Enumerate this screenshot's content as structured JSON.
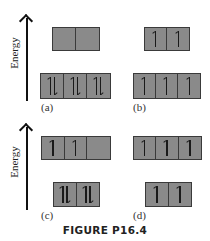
{
  "figure": {
    "caption": "FIGURE P16.4",
    "axis_label": "Energy",
    "panels": [
      {
        "label": "(a)",
        "upper_level": {
          "orbitals": 2,
          "electrons": [
            "",
            ""
          ]
        },
        "lower_level": {
          "orbitals": 3,
          "electrons": [
            "updown",
            "updown",
            "updown"
          ]
        }
      },
      {
        "label": "(b)",
        "upper_level": {
          "orbitals": 2,
          "electrons": [
            "up",
            "up"
          ]
        },
        "lower_level": {
          "orbitals": 3,
          "electrons": [
            "up",
            "up",
            "up"
          ]
        }
      },
      {
        "label": "(c)",
        "upper_level": {
          "orbitals": 3,
          "electrons": [
            "up",
            "up",
            ""
          ]
        },
        "lower_level": {
          "orbitals": 2,
          "electrons": [
            "updown",
            "updown"
          ]
        }
      },
      {
        "label": "(d)",
        "upper_level": {
          "orbitals": 3,
          "electrons": [
            "up",
            "up",
            "up"
          ]
        },
        "lower_level": {
          "orbitals": 2,
          "electrons": [
            "up",
            "up"
          ]
        }
      }
    ]
  },
  "colors": {
    "box_fill": "#8a8a8a",
    "box_border": "#3a3a3a",
    "arrow": "#111111"
  }
}
